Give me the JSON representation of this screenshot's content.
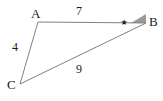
{
  "figure": {
    "background_color": "#ffffff",
    "stroke_color": "#808080",
    "text_color": "#1a1a1a",
    "angle_fill_color": "#9a9a9a",
    "vertices": [
      {
        "name": "A",
        "label": "A",
        "x": 38,
        "y": 22
      },
      {
        "name": "B",
        "label": "B",
        "x": 146,
        "y": 23
      },
      {
        "name": "C",
        "label": "C",
        "x": 20,
        "y": 84
      }
    ],
    "sides": [
      {
        "name": "AB",
        "label": "7",
        "from": "A",
        "to": "B"
      },
      {
        "name": "AC",
        "label": "4",
        "from": "A",
        "to": "C"
      },
      {
        "name": "CB",
        "label": "9",
        "from": "C",
        "to": "B"
      }
    ],
    "angle_markers": [
      {
        "at": "B",
        "glyph": "★",
        "name": "star-angle-marker",
        "shaded": true
      }
    ]
  }
}
